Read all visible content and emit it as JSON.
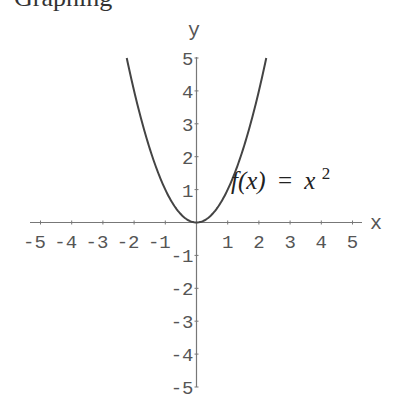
{
  "header": {
    "clipped_title": "Graphing"
  },
  "chart_data": {
    "type": "line",
    "title": "",
    "function_label": {
      "lhs": "f(x)",
      "eq": "=",
      "rhs_base": "x",
      "rhs_exp": "2"
    },
    "xlabel": "x",
    "ylabel": "y",
    "xlim": [
      -5,
      5
    ],
    "ylim": [
      -5,
      5
    ],
    "grid": false,
    "x_ticks": [
      -5,
      -4,
      -3,
      -2,
      -1,
      1,
      2,
      3,
      4,
      5
    ],
    "y_ticks": [
      5,
      4,
      3,
      2,
      1,
      -1,
      -2,
      -3,
      -4,
      -5
    ],
    "x_tick_labels": [
      "-5",
      "-4",
      "-3",
      "-2",
      "-1",
      "1",
      "2",
      "3",
      "4",
      "5"
    ],
    "y_tick_labels": [
      "5",
      "4",
      "3",
      "2",
      "1",
      "-1",
      "-2",
      "-3",
      "-4",
      "-5"
    ],
    "series": [
      {
        "name": "f(x) = x^2",
        "x": [
          -2.236,
          -2,
          -1.5,
          -1,
          -0.5,
          0,
          0.5,
          1,
          1.5,
          2,
          2.236
        ],
        "y": [
          5,
          4,
          2.25,
          1,
          0.25,
          0,
          0.25,
          1,
          2.25,
          4,
          5
        ],
        "color": "#444444"
      }
    ]
  },
  "colors": {
    "axis": "#777777",
    "curve": "#444444",
    "text": "#555555"
  }
}
